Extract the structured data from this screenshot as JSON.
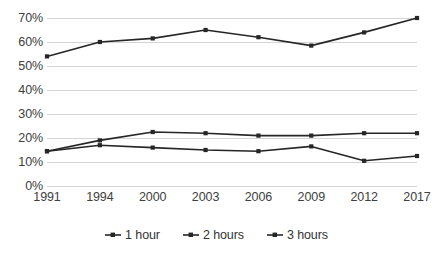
{
  "chart_data": {
    "type": "line",
    "title": "",
    "subtitle": "",
    "xlabel": "",
    "ylabel": "",
    "categories": [
      "1991",
      "1994",
      "2000",
      "2003",
      "2006",
      "2009",
      "2012",
      "2017"
    ],
    "series": [
      {
        "name": "1 hour",
        "values": [
          54,
          60,
          61.5,
          65,
          62,
          58.5,
          64,
          70
        ]
      },
      {
        "name": "2 hours",
        "values": [
          14.5,
          17,
          16,
          15,
          14.5,
          16.5,
          10.5,
          12.5
        ]
      },
      {
        "name": "3 hours",
        "values": [
          14.5,
          19,
          22.5,
          22,
          21,
          21,
          22,
          22
        ]
      }
    ],
    "ylim": [
      0,
      70
    ],
    "ytick_values": [
      0,
      10,
      20,
      30,
      40,
      50,
      60,
      70
    ],
    "ytick_labels": [
      "0%",
      "10%",
      "20%",
      "30%",
      "40%",
      "50%",
      "60%",
      "70%"
    ],
    "grid": true,
    "legend_position": "bottom",
    "value_suffix": "%",
    "colors": {
      "series_line": "#262626",
      "gridline": "#d4d4d4",
      "tick_text": "#404040",
      "legend_text": "#333333",
      "background": "#ffffff"
    },
    "legend_marker_icon": "line-with-dot-marker"
  }
}
